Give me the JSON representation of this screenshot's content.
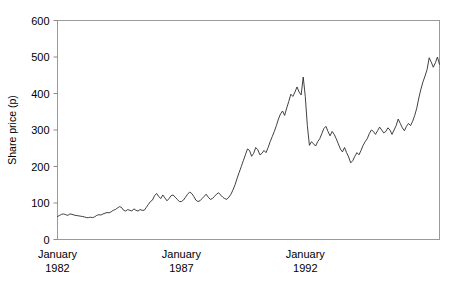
{
  "chart_data": {
    "type": "line",
    "title": "",
    "xlabel": "",
    "ylabel": "Share price (p)",
    "ylim": [
      0,
      600
    ],
    "yticks": [
      0,
      100,
      200,
      300,
      400,
      500,
      600
    ],
    "ytick_labels": [
      "0",
      "100",
      "200",
      "300",
      "400",
      "500",
      "600"
    ],
    "xtick_labels": [
      "January\n1982",
      "January\n1987",
      "January\n1992"
    ],
    "xticks_display": [
      {
        "month": "January",
        "year": "1982"
      },
      {
        "month": "January",
        "year": "1987"
      },
      {
        "month": "January",
        "year": "1992"
      }
    ],
    "grid": false,
    "legend": null,
    "x_start": "1982-01",
    "x_end": "1992-04",
    "x_step_months": 1,
    "line_color": "#2b2b2b",
    "series": [
      {
        "name": "Share price (p)",
        "values": [
          63,
          66,
          69,
          70,
          68,
          66,
          70,
          69,
          67,
          66,
          65,
          64,
          63,
          62,
          60,
          60,
          61,
          60,
          62,
          66,
          68,
          67,
          70,
          72,
          74,
          73,
          76,
          80,
          82,
          86,
          90,
          88,
          80,
          78,
          82,
          80,
          78,
          84,
          80,
          78,
          82,
          80,
          80,
          88,
          96,
          104,
          108,
          120,
          126,
          118,
          112,
          122,
          114,
          106,
          112,
          120,
          122,
          116,
          110,
          104,
          104,
          108,
          116,
          124,
          130,
          126,
          118,
          108,
          104,
          106,
          112,
          118,
          124,
          116,
          110,
          112,
          118,
          124,
          128,
          122,
          116,
          112,
          110,
          116,
          124,
          136,
          150,
          168,
          184,
          200,
          216,
          232,
          248,
          244,
          228,
          236,
          252,
          246,
          232,
          236,
          244,
          238,
          252,
          268,
          282,
          296,
          312,
          330,
          344,
          352,
          340,
          360,
          378,
          398,
          392,
          404,
          418,
          404,
          396,
          445,
          392,
          312,
          258,
          268,
          262,
          256,
          268,
          276,
          290,
          304,
          310,
          296,
          284,
          296,
          288,
          276,
          262,
          248,
          240,
          252,
          238,
          226,
          210,
          216,
          228,
          238,
          232,
          244,
          258,
          268,
          276,
          290,
          300,
          296,
          288,
          298,
          308,
          300,
          292,
          296,
          306,
          300,
          288,
          300,
          312,
          330,
          318,
          306,
          298,
          310,
          318,
          312,
          324,
          340,
          360,
          388,
          412,
          432,
          448,
          466,
          498,
          486,
          472,
          484,
          500,
          480
        ]
      }
    ]
  }
}
